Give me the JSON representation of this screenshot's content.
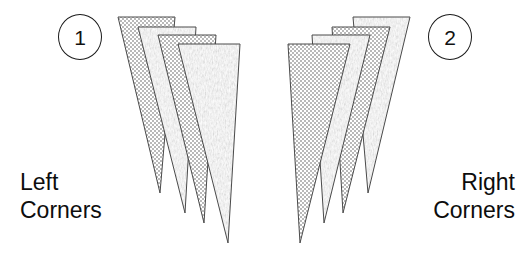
{
  "figure": {
    "background_color": "#ffffff",
    "outline_color": "#4a4a4a",
    "text_color": "#0d0d0d",
    "width": 529,
    "height": 254
  },
  "callouts": [
    {
      "name": "callout-1",
      "number": "1"
    },
    {
      "name": "callout-2",
      "number": "2"
    }
  ],
  "labels": {
    "left": {
      "line1": "Left",
      "line2": "Corners"
    },
    "right": {
      "line1": "Right",
      "line2": "Corners"
    }
  },
  "groups": [
    {
      "id": "left-group",
      "label": "Left Corners",
      "callout": "1",
      "piece_count": 4,
      "pieces": [
        {
          "index": 1,
          "fill": "checker",
          "points": "118,17 175,17 160,193 118,17"
        },
        {
          "index": 2,
          "fill": "noise",
          "points": "138,27 196,27 185,213 138,27"
        },
        {
          "index": 3,
          "fill": "checker",
          "points": "158,35 216,35 204,223 158,35"
        },
        {
          "index": 4,
          "fill": "noise",
          "points": "178,44 240,44 228,243 178,44"
        }
      ]
    },
    {
      "id": "right-group",
      "label": "Right Corners",
      "callout": "2",
      "piece_count": 4,
      "pieces": [
        {
          "index": 1,
          "fill": "noise",
          "points": "410,17 353,17 368,193 410,17"
        },
        {
          "index": 2,
          "fill": "checker",
          "points": "390,27 332,27 343,213 390,27"
        },
        {
          "index": 3,
          "fill": "noise",
          "points": "370,35 312,35 324,223 370,35"
        },
        {
          "index": 4,
          "fill": "checker",
          "points": "350,44 288,44 300,243 350,44"
        }
      ]
    }
  ],
  "patterns": {
    "checker": {
      "name": "checkerboard-fill",
      "color": "#b9b9b9",
      "cell_px": 2
    },
    "noise": {
      "name": "noise-fill",
      "color": "#bdbdbd"
    }
  }
}
